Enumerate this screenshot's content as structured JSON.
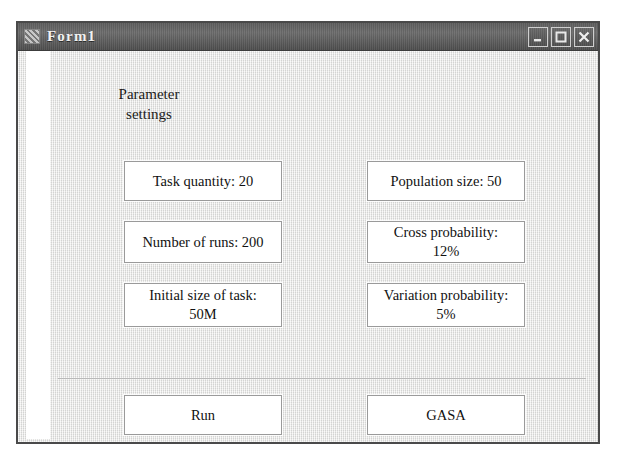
{
  "window": {
    "title": "Form1",
    "icon": "app-icon",
    "controls": [
      {
        "name": "minimize",
        "glyph": "minimize-icon"
      },
      {
        "name": "maximize",
        "glyph": "maximize-icon"
      },
      {
        "name": "close",
        "glyph": "close-icon"
      }
    ]
  },
  "section": {
    "title": "Parameter\nsettings"
  },
  "parameters": {
    "left_column": [
      {
        "name": "task-quantity",
        "label": "Task quantity: 20"
      },
      {
        "name": "number-of-runs",
        "label": "Number of runs: 200"
      },
      {
        "name": "initial-size-of-task",
        "label": "Initial size of task:\n50M"
      }
    ],
    "right_column": [
      {
        "name": "population-size",
        "label": "Population size: 50"
      },
      {
        "name": "cross-probability",
        "label": "Cross probability:\n12%"
      },
      {
        "name": "variation-probability",
        "label": "Variation probability:\n5%"
      }
    ]
  },
  "actions": [
    {
      "name": "run",
      "label": "Run"
    },
    {
      "name": "gasa",
      "label": "GASA"
    }
  ],
  "colors": {
    "titlebar": "#5e5e5e",
    "client_background": "#e9e9e8",
    "button_background": "#ffffff",
    "button_border": "#9a9a9a",
    "text": "#111111",
    "title_text": "#f2f2f2"
  }
}
